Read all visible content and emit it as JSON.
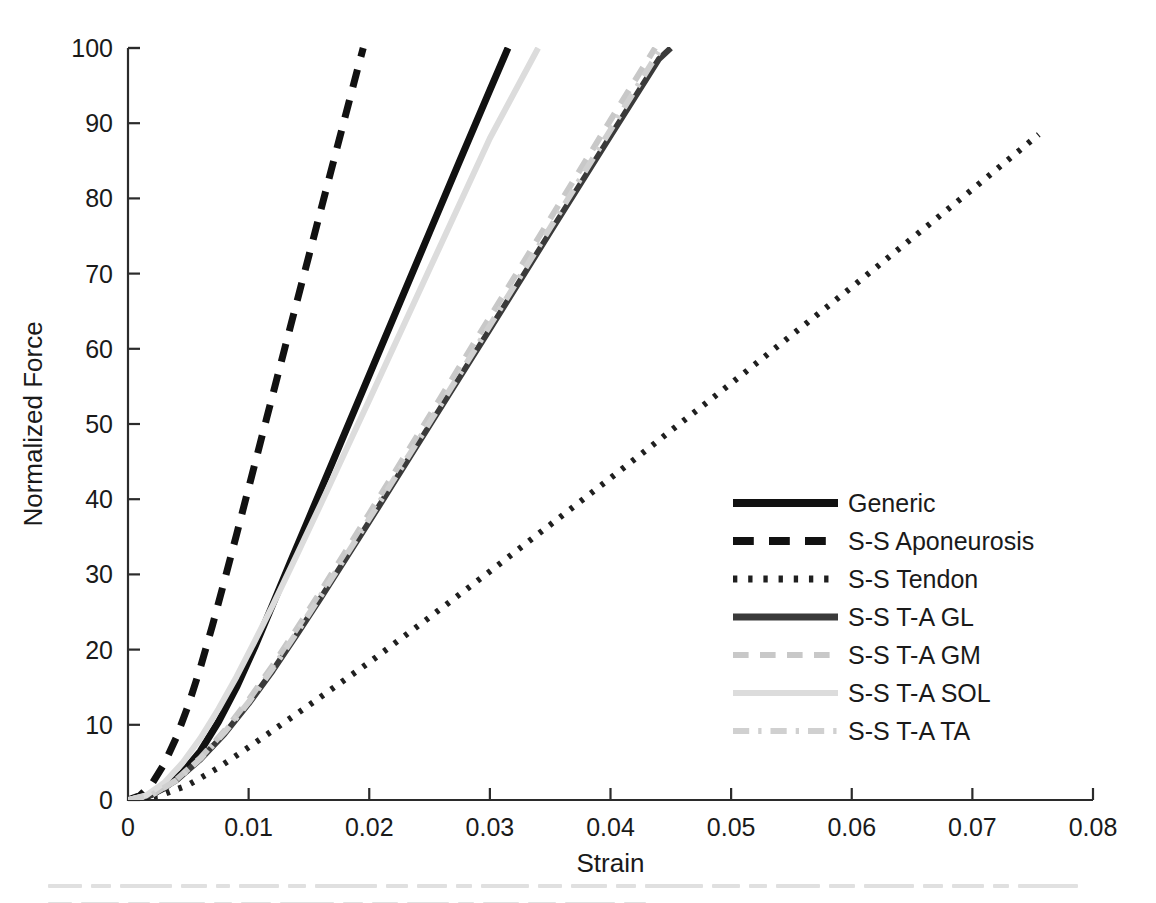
{
  "chart_data": {
    "type": "line",
    "title": "",
    "xlabel": "Strain",
    "ylabel": "Normalized Force",
    "xlim": [
      0,
      0.08
    ],
    "ylim": [
      0,
      100
    ],
    "xticks": [
      0,
      0.01,
      0.02,
      0.03,
      0.04,
      0.05,
      0.06,
      0.07,
      0.08
    ],
    "xtick_labels": [
      "0",
      "0.01",
      "0.02",
      "0.03",
      "0.04",
      "0.05",
      "0.06",
      "0.07",
      "0.08"
    ],
    "yticks": [
      0,
      10,
      20,
      30,
      40,
      50,
      60,
      70,
      80,
      90,
      100
    ],
    "ytick_labels": [
      "0",
      "10",
      "20",
      "30",
      "40",
      "50",
      "60",
      "70",
      "80",
      "90",
      "100"
    ],
    "grid": false,
    "legend_position": "center-right",
    "series": [
      {
        "name": "Generic",
        "style": "solid",
        "color": "#111111",
        "width": 7,
        "points": [
          [
            0.0,
            0.0
          ],
          [
            0.0015,
            0.4
          ],
          [
            0.003,
            1.6
          ],
          [
            0.0045,
            3.6
          ],
          [
            0.006,
            6.5
          ],
          [
            0.0075,
            10.4
          ],
          [
            0.009,
            15.0
          ],
          [
            0.0105,
            20.3
          ],
          [
            0.012,
            26.0
          ],
          [
            0.0135,
            31.8
          ],
          [
            0.015,
            37.5
          ],
          [
            0.0175,
            47.0
          ],
          [
            0.02,
            56.5
          ],
          [
            0.0225,
            66.0
          ],
          [
            0.025,
            75.5
          ],
          [
            0.0275,
            85.0
          ],
          [
            0.03,
            94.4
          ],
          [
            0.0315,
            100.0
          ]
        ]
      },
      {
        "name": "S-S Aponeurosis",
        "style": "dashed",
        "color": "#111111",
        "width": 7,
        "points": [
          [
            0.0,
            0.0
          ],
          [
            0.001,
            0.6
          ],
          [
            0.002,
            2.2
          ],
          [
            0.003,
            4.8
          ],
          [
            0.004,
            8.3
          ],
          [
            0.005,
            12.6
          ],
          [
            0.006,
            17.6
          ],
          [
            0.007,
            23.2
          ],
          [
            0.008,
            29.2
          ],
          [
            0.009,
            35.3
          ],
          [
            0.01,
            41.5
          ],
          [
            0.0115,
            50.8
          ],
          [
            0.013,
            60.1
          ],
          [
            0.015,
            72.4
          ],
          [
            0.017,
            84.7
          ],
          [
            0.019,
            97.0
          ],
          [
            0.0195,
            100.0
          ]
        ]
      },
      {
        "name": "S-S Tendon",
        "style": "dotted",
        "color": "#1f1f1f",
        "width": 6,
        "points": [
          [
            0.0,
            0.0
          ],
          [
            0.0025,
            0.5
          ],
          [
            0.005,
            2.0
          ],
          [
            0.0075,
            4.3
          ],
          [
            0.01,
            7.0
          ],
          [
            0.0125,
            9.8
          ],
          [
            0.015,
            12.6
          ],
          [
            0.02,
            18.3
          ],
          [
            0.025,
            24.3
          ],
          [
            0.03,
            30.4
          ],
          [
            0.035,
            36.6
          ],
          [
            0.04,
            42.8
          ],
          [
            0.045,
            49.1
          ],
          [
            0.05,
            55.4
          ],
          [
            0.055,
            61.8
          ],
          [
            0.06,
            68.2
          ],
          [
            0.065,
            74.7
          ],
          [
            0.07,
            81.2
          ],
          [
            0.0755,
            88.5
          ]
        ]
      },
      {
        "name": "S-S T-A GL",
        "style": "solid",
        "color": "#3a3a3a",
        "width": 6,
        "points": [
          [
            0.0,
            0.0
          ],
          [
            0.002,
            0.7
          ],
          [
            0.004,
            2.6
          ],
          [
            0.006,
            5.4
          ],
          [
            0.008,
            8.8
          ],
          [
            0.01,
            12.8
          ],
          [
            0.012,
            17.2
          ],
          [
            0.014,
            22.0
          ],
          [
            0.016,
            26.9
          ],
          [
            0.02,
            37.0
          ],
          [
            0.025,
            49.8
          ],
          [
            0.03,
            62.6
          ],
          [
            0.035,
            75.5
          ],
          [
            0.04,
            88.3
          ],
          [
            0.044,
            98.5
          ],
          [
            0.045,
            100.0
          ]
        ]
      },
      {
        "name": "S-S T-A GM",
        "style": "dashed",
        "color": "#c8c8c8",
        "width": 6,
        "points": [
          [
            0.0,
            0.0
          ],
          [
            0.002,
            0.7
          ],
          [
            0.004,
            2.7
          ],
          [
            0.006,
            5.6
          ],
          [
            0.008,
            9.2
          ],
          [
            0.01,
            13.3
          ],
          [
            0.012,
            17.9
          ],
          [
            0.014,
            22.8
          ],
          [
            0.016,
            27.8
          ],
          [
            0.02,
            38.1
          ],
          [
            0.025,
            51.1
          ],
          [
            0.03,
            64.2
          ],
          [
            0.035,
            77.3
          ],
          [
            0.04,
            90.4
          ],
          [
            0.043,
            98.2
          ],
          [
            0.0437,
            100.0
          ]
        ]
      },
      {
        "name": "S-S T-A SOL",
        "style": "solid",
        "color": "#dcdcdc",
        "width": 6,
        "points": [
          [
            0.0,
            0.0
          ],
          [
            0.0015,
            0.6
          ],
          [
            0.003,
            2.3
          ],
          [
            0.0045,
            4.9
          ],
          [
            0.006,
            8.2
          ],
          [
            0.0075,
            12.1
          ],
          [
            0.009,
            16.4
          ],
          [
            0.0105,
            21.1
          ],
          [
            0.012,
            25.9
          ],
          [
            0.014,
            32.6
          ],
          [
            0.016,
            39.4
          ],
          [
            0.02,
            53.2
          ],
          [
            0.025,
            70.6
          ],
          [
            0.03,
            88.0
          ],
          [
            0.034,
            100.0
          ]
        ]
      },
      {
        "name": "S-S T-A TA",
        "style": "dashdot",
        "color": "#d0d0d0",
        "width": 6,
        "points": [
          [
            0.0,
            0.0
          ],
          [
            0.002,
            0.7
          ],
          [
            0.004,
            2.6
          ],
          [
            0.006,
            5.5
          ],
          [
            0.008,
            9.0
          ],
          [
            0.01,
            13.0
          ],
          [
            0.012,
            17.5
          ],
          [
            0.014,
            22.3
          ],
          [
            0.016,
            27.2
          ],
          [
            0.02,
            37.4
          ],
          [
            0.025,
            50.2
          ],
          [
            0.03,
            63.1
          ],
          [
            0.035,
            76.1
          ],
          [
            0.04,
            89.1
          ],
          [
            0.044,
            99.5
          ],
          [
            0.0445,
            100.0
          ]
        ]
      }
    ]
  },
  "legend": {
    "entries": [
      {
        "label": "Generic",
        "style": "solid",
        "color": "#111111",
        "width": 8
      },
      {
        "label": "S-S Aponeurosis",
        "style": "dashed",
        "color": "#111111",
        "width": 8
      },
      {
        "label": "S-S Tendon",
        "style": "dotted",
        "color": "#1f1f1f",
        "width": 7
      },
      {
        "label": "S-S T-A GL",
        "style": "solid",
        "color": "#3a3a3a",
        "width": 7
      },
      {
        "label": "S-S T-A GM",
        "style": "dashed",
        "color": "#c8c8c8",
        "width": 6
      },
      {
        "label": "S-S T-A SOL",
        "style": "solid",
        "color": "#dcdcdc",
        "width": 6
      },
      {
        "label": "S-S T-A TA",
        "style": "dashdot",
        "color": "#d0d0d0",
        "width": 6
      }
    ]
  }
}
